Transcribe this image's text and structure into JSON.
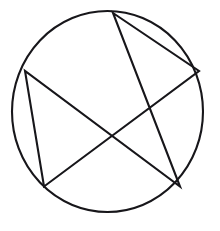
{
  "figure": {
    "title": "Pentagram inscribed in a circle",
    "description": "A five-pointed star drawn with a single continuous line, enclosed by a circle",
    "background_color": "#ffffff",
    "stroke_color": "#17161a",
    "canvas": {
      "width": 220,
      "height": 231
    },
    "circle": {
      "name": "circumscribed-circle",
      "center_x": 107.5,
      "center_y": 111.5,
      "radius_x": 95.5,
      "radius_y": 100.5,
      "stroke_width": 2.1
    },
    "star": {
      "name": "pentagram",
      "stroke_width": 2.1,
      "points_count": 5,
      "vertices": [
        {
          "label": "top",
          "x": 113,
          "y": 13
        },
        {
          "label": "right",
          "x": 199,
          "y": 71
        },
        {
          "label": "bottom-left",
          "x": 44,
          "y": 186.5
        },
        {
          "label": "left",
          "x": 25,
          "y": 71
        },
        {
          "label": "bottom-right",
          "x": 180,
          "y": 186.5
        }
      ],
      "path": "M 113 13 L 199 71 L 44 186.5 L 25 71 L 180 186.5 Z"
    }
  }
}
